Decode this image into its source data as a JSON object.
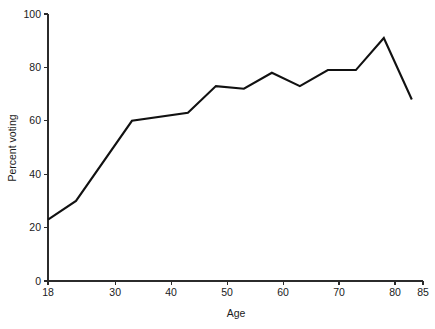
{
  "chart_data": {
    "type": "line",
    "title": "",
    "subtitle": "",
    "xlabel": "Age",
    "ylabel": "Percent voting",
    "xlim": [
      18,
      85
    ],
    "ylim": [
      0,
      100
    ],
    "grid": false,
    "legend": "none",
    "x_ticks": [
      18,
      30,
      40,
      50,
      60,
      70,
      80,
      85
    ],
    "x_tick_labels": [
      "18",
      "30",
      "40",
      "50",
      "60",
      "70",
      "80",
      "85"
    ],
    "y_ticks": [
      0,
      20,
      40,
      60,
      80,
      100
    ],
    "y_tick_labels": [
      "0",
      "20",
      "40",
      "60",
      "80",
      "100"
    ],
    "line_color": "#111111",
    "series": [
      {
        "name": "Percent voting",
        "x": [
          18,
          23,
          33,
          43,
          48,
          53,
          58,
          63,
          68,
          73,
          78,
          83
        ],
        "values": [
          23,
          30,
          60,
          63,
          73,
          72,
          78,
          73,
          79,
          79,
          91,
          68
        ]
      }
    ]
  },
  "axes": {
    "x_axis_name": "Age",
    "y_axis_name": "Percent voting"
  }
}
